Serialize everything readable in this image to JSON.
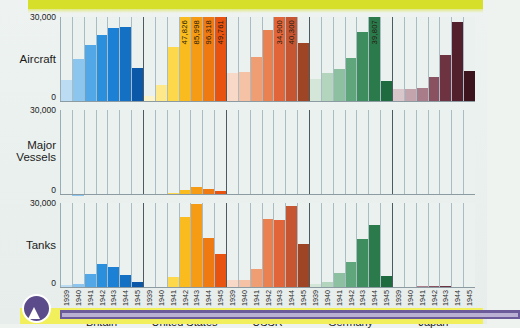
{
  "figure": {
    "title": "",
    "panel_max_label": "30,000",
    "panel_zero_label": "0"
  },
  "decor": {
    "top_band_color": "#d6e02a",
    "bottom_band_color": "#f2ef5c",
    "bottom_bar_color": "#6b5b9a",
    "bullet_icon": "chevron-up-icon"
  },
  "chart_data": {
    "type": "bar",
    "title": "",
    "subtitle": "",
    "xlabel": "",
    "ylabel": "",
    "ylim": [
      0,
      30000
    ],
    "grid": true,
    "legend": "none",
    "years": [
      "1939",
      "1940",
      "1941",
      "1942",
      "1943",
      "1944",
      "1945"
    ],
    "countries": [
      "Britain",
      "United States",
      "USSR",
      "Germany",
      "Japan"
    ],
    "country_colors": {
      "Britain": "#1f7fd0",
      "United States": "#f5a11a",
      "USSR": "#e07040",
      "Germany": "#2f7d4f",
      "Japan": "#6b2733"
    },
    "country_shades": {
      "Britain": [
        "#bcdcf4",
        "#8cc6ef",
        "#52a8e6",
        "#2a90dd",
        "#1c81d4",
        "#1470c2",
        "#0b57a8"
      ],
      "United States": [
        "#fdf3c8",
        "#fde98a",
        "#fcd84a",
        "#f9bb1d",
        "#f59b14",
        "#f07a12",
        "#e8530f"
      ],
      "USSR": [
        "#f8d9c8",
        "#f5c2a6",
        "#ef9d73",
        "#ea8150",
        "#e2653a",
        "#c55631",
        "#9e4526"
      ],
      "Germany": [
        "#d3e6d8",
        "#b3d5bd",
        "#8cc0a0",
        "#5fa67d",
        "#3d8d5f",
        "#2b7a4c",
        "#1d6b3e"
      ],
      "Japan": [
        "#d9c6cb",
        "#c3a4ac",
        "#a87c88",
        "#8a5260",
        "#6e3341",
        "#52202c",
        "#3c141d"
      ]
    },
    "panels": [
      {
        "name": "Aircraft",
        "label": "Aircraft",
        "ymax": 30000,
        "series": [
          {
            "name": "Britain",
            "values": [
              7940,
              15049,
              20094,
              23672,
              26263,
              26461,
              12070
            ]
          },
          {
            "name": "United States",
            "values": [
              2141,
              6086,
              19433,
              47826,
              85998,
              96318,
              49761
            ]
          },
          {
            "name": "USSR",
            "values": [
              10382,
              10565,
              15735,
              25436,
              34900,
              40300,
              20900
            ]
          },
          {
            "name": "Germany",
            "values": [
              8295,
              10247,
              11776,
              15409,
              24807,
              39807,
              7540
            ]
          },
          {
            "name": "Japan",
            "values": [
              4467,
              4768,
              5088,
              8861,
              16693,
              28180,
              11066
            ]
          }
        ]
      },
      {
        "name": "Major Vessels",
        "label": "Major Vessels",
        "ymax": 30000,
        "series": [
          {
            "name": "Britain",
            "values": [
              57,
              148,
              236,
              239,
              224,
              188,
              64
            ]
          },
          {
            "name": "United States",
            "values": [
              0,
              0,
              544,
              1854,
              2654,
              2247,
              1513
            ]
          },
          {
            "name": "USSR",
            "values": [
              0,
              33,
              62,
              19,
              13,
              23,
              11
            ]
          },
          {
            "name": "Germany",
            "values": [
              15,
              40,
              196,
              244,
              270,
              189,
              0
            ]
          },
          {
            "name": "Japan",
            "values": [
              21,
              30,
              49,
              68,
              122,
              248,
              51
            ]
          }
        ]
      },
      {
        "name": "Tanks",
        "label": "Tanks",
        "ymax": 30000,
        "series": [
          {
            "name": "Britain",
            "values": [
              969,
              1399,
              4841,
              8611,
              7476,
              4600,
              2100
            ]
          },
          {
            "name": "United States",
            "values": [
              0,
              331,
              4052,
              24997,
              29497,
              17565,
              11968
            ]
          },
          {
            "name": "USSR",
            "values": [
              2950,
              2794,
              6590,
              24446,
              24089,
              28963,
              15400
            ]
          },
          {
            "name": "Germany",
            "values": [
              1300,
              2200,
              5200,
              9200,
              17300,
              22100,
              4400
            ]
          },
          {
            "name": "Japan",
            "values": [
              200,
              315,
              595,
              557,
              558,
              353,
              137
            ]
          }
        ]
      }
    ],
    "value_labels": [
      {
        "panel": "Aircraft",
        "country": "United States",
        "year": "1942",
        "text": "47,826"
      },
      {
        "panel": "Aircraft",
        "country": "United States",
        "year": "1943",
        "text": "85,998"
      },
      {
        "panel": "Aircraft",
        "country": "United States",
        "year": "1944",
        "text": "96,318"
      },
      {
        "panel": "Aircraft",
        "country": "United States",
        "year": "1945",
        "text": "49,761"
      },
      {
        "panel": "Aircraft",
        "country": "USSR",
        "year": "1943",
        "text": "34,900"
      },
      {
        "panel": "Aircraft",
        "country": "USSR",
        "year": "1944",
        "text": "40,300"
      },
      {
        "panel": "Aircraft",
        "country": "Germany",
        "year": "1944",
        "text": "39,807"
      }
    ]
  }
}
